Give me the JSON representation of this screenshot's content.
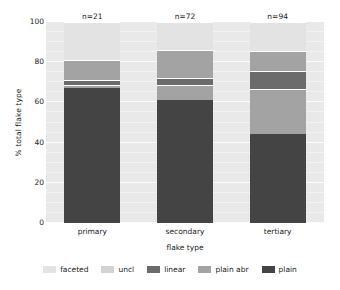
{
  "chart_data": {
    "type": "bar",
    "title": "",
    "subtitle": "",
    "xlabel": "flake type",
    "ylabel": "% total flake type",
    "ylim": [
      0,
      100
    ],
    "yticks": [
      100,
      80,
      60,
      40,
      20,
      0
    ],
    "grid": true,
    "stacked": true,
    "stack_order_bottom_to_top": [
      "plain",
      "plain abr",
      "linear",
      "uncl",
      "faceted"
    ],
    "legend_position": "bottom",
    "categories": [
      "primary",
      "secondary",
      "tertiary"
    ],
    "category_annotations": [
      "n=21",
      "n=72",
      "n=94"
    ],
    "series": [
      {
        "name": "faceted",
        "color": "#e3e3e3",
        "values": [
          19.0,
          14.0,
          14.5
        ]
      },
      {
        "name": "uncl",
        "color": "#d2d2d2",
        "values": [
          0.0,
          0.0,
          0.0
        ]
      },
      {
        "name": "linear",
        "color": "#6b6b6b",
        "values": [
          4.5,
          2.8,
          8.0
        ]
      },
      {
        "name": "plain abr",
        "color": "#a3a3a3",
        "values": [
          9.5,
          22.2,
          33.0
        ]
      },
      {
        "name": "plain",
        "color": "#444444",
        "values": [
          67.0,
          61.0,
          44.5
        ]
      }
    ],
    "stacks": [
      {
        "category": "primary",
        "n": "n=21",
        "segments": [
          {
            "name": "plain",
            "start": 0,
            "end": 67,
            "color": "#444444"
          },
          {
            "name": "plain abr",
            "start": 67,
            "end": 68.5,
            "color": "#a3a3a3"
          },
          {
            "name": "linear",
            "start": 68.5,
            "end": 71,
            "color": "#6b6b6b"
          },
          {
            "name": "plain abr",
            "start": 71,
            "end": 81,
            "color": "#a3a3a3"
          },
          {
            "name": "faceted",
            "start": 81,
            "end": 100,
            "color": "#e3e3e3"
          }
        ]
      },
      {
        "category": "secondary",
        "n": "n=72",
        "segments": [
          {
            "name": "plain",
            "start": 0,
            "end": 61,
            "color": "#444444"
          },
          {
            "name": "plain abr",
            "start": 61,
            "end": 68.5,
            "color": "#a3a3a3"
          },
          {
            "name": "linear",
            "start": 68.5,
            "end": 72,
            "color": "#6b6b6b"
          },
          {
            "name": "plain abr",
            "start": 72,
            "end": 86,
            "color": "#a3a3a3"
          },
          {
            "name": "faceted",
            "start": 86,
            "end": 100,
            "color": "#e3e3e3"
          }
        ]
      },
      {
        "category": "tertiary",
        "n": "n=94",
        "segments": [
          {
            "name": "plain",
            "start": 0,
            "end": 44.5,
            "color": "#444444"
          },
          {
            "name": "plain abr",
            "start": 44.5,
            "end": 66.5,
            "color": "#a3a3a3"
          },
          {
            "name": "linear",
            "start": 66.5,
            "end": 75.5,
            "color": "#6b6b6b"
          },
          {
            "name": "plain abr",
            "start": 75.5,
            "end": 85.5,
            "color": "#a3a3a3"
          },
          {
            "name": "faceted",
            "start": 85.5,
            "end": 100,
            "color": "#e3e3e3"
          }
        ]
      }
    ],
    "legend": [
      {
        "label": "faceted",
        "color": "#e3e3e3"
      },
      {
        "label": "uncl",
        "color": "#d2d2d2"
      },
      {
        "label": "linear",
        "color": "#6b6b6b"
      },
      {
        "label": "plain abr",
        "color": "#a3a3a3"
      },
      {
        "label": "plain",
        "color": "#444444"
      }
    ],
    "plot_background": "#e9e9e9",
    "gridline_color": "#fbfbfb"
  }
}
